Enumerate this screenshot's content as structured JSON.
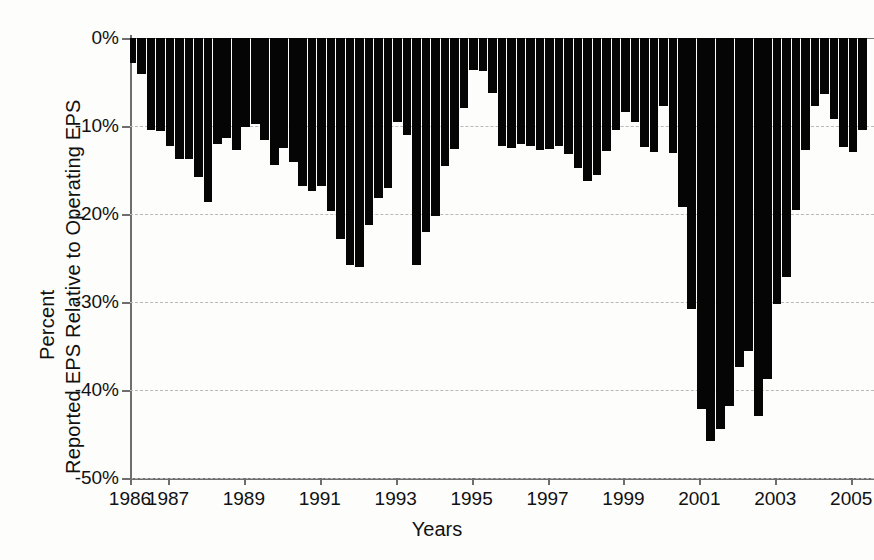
{
  "chart_data": {
    "type": "bar",
    "title": "",
    "xlabel": "Years",
    "ylabel": "Percent\nReported EPS Relative to Operating EPS",
    "ylabel_lines": [
      "Percent",
      "Reported EPS Relative to Operating EPS"
    ],
    "ylim": [
      -50,
      0
    ],
    "xlim": [
      1986.0,
      2005.6
    ],
    "grid": true,
    "legend": null,
    "y_tick_labels": [
      "0%",
      "-10%",
      "-20%",
      "-30%",
      "-40%",
      "-50%"
    ],
    "y_tick_values": [
      0,
      -10,
      -20,
      -30,
      -40,
      -50
    ],
    "x_tick_labels": [
      "1986",
      "1987",
      "1989",
      "1991",
      "1993",
      "1995",
      "1997",
      "1999",
      "2001",
      "2003",
      "2005"
    ],
    "x_tick_values": [
      1986,
      1987,
      1989,
      1991,
      1993,
      1995,
      1997,
      1999,
      2001,
      2003,
      2005
    ],
    "series_name": "Reported EPS relative to Operating EPS",
    "bar_color": "#050505",
    "x": [
      1986.05,
      1986.3,
      1986.55,
      1986.8,
      1987.05,
      1987.3,
      1987.55,
      1987.8,
      1988.05,
      1988.3,
      1988.55,
      1988.8,
      1989.05,
      1989.3,
      1989.55,
      1989.8,
      1990.05,
      1990.3,
      1990.55,
      1990.8,
      1991.05,
      1991.3,
      1991.55,
      1991.8,
      1992.05,
      1992.3,
      1992.55,
      1992.8,
      1993.05,
      1993.3,
      1993.55,
      1993.8,
      1994.05,
      1994.3,
      1994.55,
      1994.8,
      1995.05,
      1995.3,
      1995.55,
      1995.8,
      1996.05,
      1996.3,
      1996.55,
      1996.8,
      1997.05,
      1997.3,
      1997.55,
      1997.8,
      1998.05,
      1998.3,
      1998.55,
      1998.8,
      1999.05,
      1999.3,
      1999.55,
      1999.8,
      2000.05,
      2000.3,
      2000.55,
      2000.8,
      2001.05,
      2001.3,
      2001.55,
      2001.8,
      2002.05,
      2002.3,
      2002.55,
      2002.8,
      2003.05,
      2003.3,
      2003.55,
      2003.8,
      2004.05,
      2004.3,
      2004.55,
      2004.8,
      2005.05,
      2005.3
    ],
    "values": [
      -2.8,
      -4.1,
      -10.5,
      -10.6,
      -12.3,
      -13.7,
      -13.8,
      -15.8,
      -18.6,
      -12.0,
      -11.4,
      -12.7,
      -10.1,
      -9.8,
      -11.6,
      -14.4,
      -12.5,
      -14.1,
      -16.8,
      -17.4,
      -16.8,
      -19.7,
      -22.8,
      -25.8,
      -26.0,
      -21.3,
      -18.2,
      -17.0,
      -9.5,
      -11.0,
      -25.8,
      -22.0,
      -20.2,
      -14.6,
      -12.6,
      -8.0,
      -3.6,
      -3.8,
      -6.2,
      -12.3,
      -12.5,
      -12.0,
      -12.3,
      -12.7,
      -12.6,
      -12.3,
      -13.2,
      -14.8,
      -16.2,
      -15.6,
      -12.8,
      -10.5,
      -8.4,
      -9.5,
      -12.4,
      -13.0,
      -7.7,
      -13.1,
      -19.2,
      -30.8,
      -42.2,
      -45.8,
      -44.4,
      -41.8,
      -37.4,
      -35.6,
      -43.0,
      -38.8,
      -30.2,
      -27.2,
      -19.5,
      -12.7,
      -7.7,
      -6.4,
      -9.2,
      -12.4,
      -13.0,
      -10.4
    ]
  }
}
